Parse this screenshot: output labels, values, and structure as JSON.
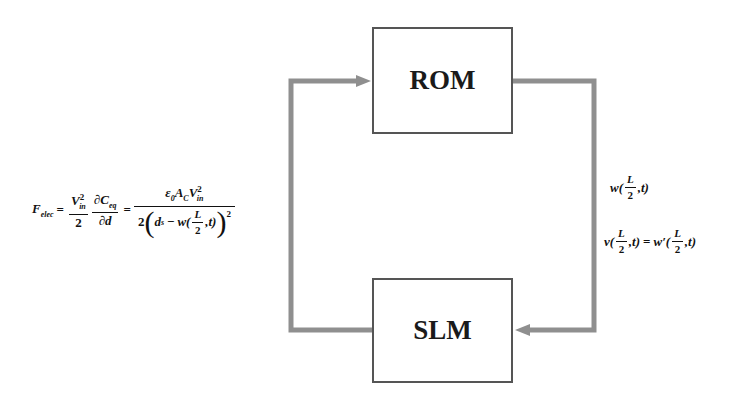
{
  "blocks": {
    "top": {
      "label": "ROM"
    },
    "bottom": {
      "label": "SLM"
    }
  },
  "left_equation": {
    "lhs": "F",
    "lhs_sub": "elec",
    "eq": "=",
    "t1_num_base": "V",
    "t1_num_sup": "2",
    "t1_num_sub": "in",
    "t1_den": "2",
    "t2_num": "∂C",
    "t2_num_sub": "eq",
    "t2_den": "∂d",
    "eq2": "=",
    "t3_num_a": "ε",
    "t3_num_a_sub": "0",
    "t3_num_b": "A",
    "t3_num_b_sub": "C",
    "t3_num_c": "V",
    "t3_num_c_sup": "2",
    "t3_num_c_sub": "in",
    "t3_den_coef": "2",
    "t3_den_d": "d",
    "t3_den_d_sub": "s",
    "t3_den_minus": "−",
    "t3_den_w": "w(",
    "t3_den_L": "L",
    "t3_den_2": "2",
    "t3_den_t": ",t)",
    "t3_den_pow": "2"
  },
  "right_labels": {
    "line1_w": "w(",
    "line1_L": "L",
    "line1_2": "2",
    "line1_t": ",t)",
    "line2_v": "v(",
    "line2_L": "L",
    "line2_2": "2",
    "line2_t": ",t)",
    "line2_eq": "=",
    "line2_w": "w′(",
    "line2_L2": "L",
    "line2_22": "2",
    "line2_t2": ",t)"
  },
  "colors": {
    "arrow": "#8f8f8f",
    "box_border": "#555555",
    "text": "#111111"
  }
}
